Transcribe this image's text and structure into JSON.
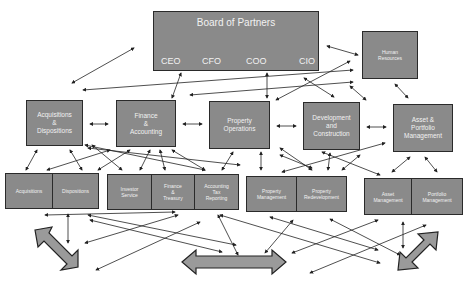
{
  "board": {
    "title": "Board of Partners",
    "executives": [
      "CEO",
      "CFO",
      "COO",
      "CIO"
    ]
  },
  "human_resources": {
    "label": "Human\nResources"
  },
  "departments": [
    {
      "id": "acq-disp",
      "label": "Acquisitions\n&\nDispositions"
    },
    {
      "id": "fin-acct",
      "label": "Finance\n&\nAccounting"
    },
    {
      "id": "prop-ops",
      "label": "Property\nOperations"
    },
    {
      "id": "dev-con",
      "label": "Development\nand\nConstruction"
    },
    {
      "id": "asset-port",
      "label": "Asset &\nPortfolio\nManagement"
    }
  ],
  "sub_units": [
    {
      "group": "acq-disp",
      "items": [
        "Acquisitions",
        "Dispositions"
      ]
    },
    {
      "group": "fin-acct",
      "items": [
        "Investor\nService",
        "Finance\n&\nTreasury",
        "Accounting\nTax\nReporting"
      ]
    },
    {
      "group": "prop-ops",
      "items": [
        "Property\nManagement",
        "Property\nRedevelopment"
      ]
    },
    {
      "group": "asset-port",
      "items": [
        "Asset\nManagement",
        "Portfolio\nManagement"
      ]
    }
  ],
  "colors": {
    "box_fill": "#8a8a8a",
    "box_border": "#2a2a2a",
    "text": "#f2f2f2",
    "arrow": "#222222",
    "big_arrow_fill": "#9a9a9a"
  }
}
